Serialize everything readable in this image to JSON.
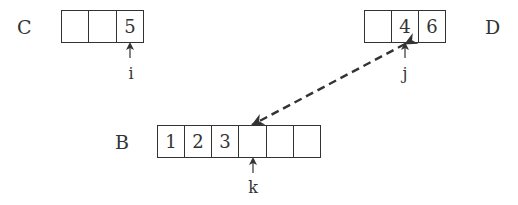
{
  "arrays": {
    "C": {
      "label": "C",
      "cells": [
        "",
        "",
        "5"
      ]
    },
    "D": {
      "label": "D",
      "cells": [
        "",
        "4",
        "6"
      ]
    },
    "B": {
      "label": "B",
      "cells": [
        "1",
        "2",
        "3",
        "",
        "",
        ""
      ]
    }
  },
  "pointers": {
    "i": {
      "label": "i",
      "array": "C",
      "index": 2
    },
    "j": {
      "label": "j",
      "array": "D",
      "index": 1
    },
    "k": {
      "label": "k",
      "array": "B",
      "index": 3
    }
  },
  "connector": {
    "from": "D[1]",
    "to": "B[3]",
    "style": "dashed",
    "heads": "both"
  },
  "colors": {
    "stroke": "#333333",
    "background": "#ffffff"
  }
}
